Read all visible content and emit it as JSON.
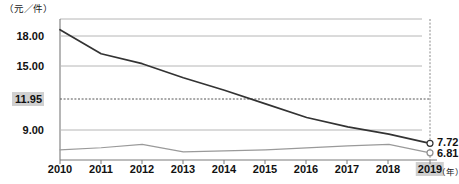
{
  "axes": {
    "y_unit_label": "（元／件）",
    "x_unit_label": "（年）",
    "y_ticks": [
      "18.00",
      "15.00",
      "11.95",
      "9.00"
    ],
    "x_ticks": [
      "2010",
      "2011",
      "2012",
      "2013",
      "2014",
      "2015",
      "2016",
      "2017",
      "2018",
      "2019"
    ],
    "highlighted_y_tick": "11.95",
    "highlighted_x_tick": "2019"
  },
  "end_labels": {
    "series1": "7.72",
    "series2": "6.81"
  },
  "colors": {
    "series1_line": "#333333",
    "series2_line": "#9a9a9a",
    "gridline": "#b6b6b6",
    "axis": "#7a7a7a",
    "highlight_bg": "#d0d0d0",
    "dashed_guide": "#555555"
  },
  "chart_data": {
    "type": "line",
    "title": "",
    "subtitle": "",
    "xlabel": "（年）",
    "ylabel": "（元／件）",
    "grid": true,
    "legend": "none",
    "x": [
      2010,
      2011,
      2012,
      2013,
      2014,
      2015,
      2016,
      2017,
      2018,
      2019
    ],
    "xlim": [
      2010,
      2019
    ],
    "ylim": [
      5.9,
      19.2
    ],
    "ytick_values": [
      18.0,
      15.0,
      11.95,
      9.0
    ],
    "guide_lines": [
      {
        "type": "horizontal",
        "value": 11.95,
        "style": "dashed"
      },
      {
        "type": "vertical",
        "value": 2019,
        "style": "dashed"
      }
    ],
    "series": [
      {
        "name": "series1",
        "color": "#333333",
        "marker_end": "circle",
        "end_value": 7.72,
        "values": [
          18.6,
          16.3,
          15.35,
          14.0,
          12.8,
          11.5,
          10.2,
          9.3,
          8.6,
          7.72
        ]
      },
      {
        "name": "series2",
        "color": "#9a9a9a",
        "marker_end": "circle",
        "end_value": 6.81,
        "values": [
          7.1,
          7.3,
          7.62,
          6.9,
          7.0,
          7.1,
          7.28,
          7.48,
          7.62,
          6.81
        ]
      }
    ]
  }
}
